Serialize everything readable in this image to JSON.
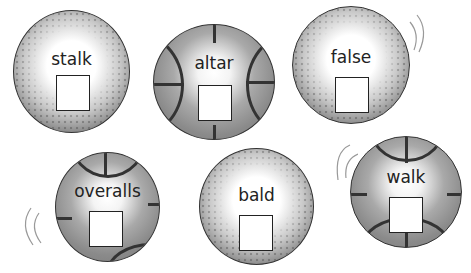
{
  "header": {
    "cut_text": "page header (cut off)"
  },
  "balls": [
    {
      "word": "stalk",
      "style": "speckled"
    },
    {
      "word": "altar",
      "style": "basketball"
    },
    {
      "word": "false",
      "style": "speckled"
    },
    {
      "word": "overalls",
      "style": "basketball"
    },
    {
      "word": "bald",
      "style": "speckled"
    },
    {
      "word": "walk",
      "style": "basketball"
    }
  ],
  "colors": {
    "ball_dark": "#6e6e6e",
    "ball_basket": "#8a8a8a",
    "seam": "#333333",
    "box_bg": "#ffffff"
  }
}
